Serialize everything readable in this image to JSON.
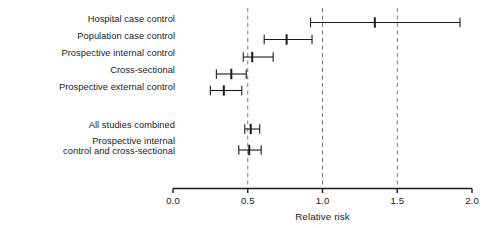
{
  "chart_data": {
    "type": "forest",
    "title": "",
    "xlabel": "Relative risk",
    "ylabel": "",
    "xlim": [
      0.0,
      2.0
    ],
    "grid": true,
    "gridlines": [
      0.5,
      1.0,
      1.5
    ],
    "gridline_style": "dashed",
    "legend": "none",
    "tick_labels": [
      "0.0",
      "0.5",
      "1.0",
      "1.5",
      "2.0"
    ],
    "tick_values": [
      0.0,
      0.5,
      1.0,
      1.5,
      2.0
    ],
    "categories": [
      "Hospital case control",
      "Population case control",
      "Prospective internal control",
      "Cross-sectional",
      "Prospective external control",
      "All studies combined",
      "Prospective internal\ncontrol and cross-sectional"
    ],
    "rows": [
      {
        "label": "Hospital case control",
        "label_lines": [
          "Hospital case control"
        ],
        "estimate": 1.35,
        "ci_low": 0.92,
        "ci_high": 1.92,
        "group": "individual"
      },
      {
        "label": "Population case control",
        "label_lines": [
          "Population case control"
        ],
        "estimate": 0.76,
        "ci_low": 0.61,
        "ci_high": 0.93,
        "group": "individual"
      },
      {
        "label": "Prospective internal control",
        "label_lines": [
          "Prospective internal control"
        ],
        "estimate": 0.53,
        "ci_low": 0.47,
        "ci_high": 0.67,
        "group": "individual"
      },
      {
        "label": "Cross-sectional",
        "label_lines": [
          "Cross-sectional"
        ],
        "estimate": 0.39,
        "ci_low": 0.29,
        "ci_high": 0.49,
        "group": "individual"
      },
      {
        "label": "Prospective external control",
        "label_lines": [
          "Prospective external control"
        ],
        "estimate": 0.34,
        "ci_low": 0.25,
        "ci_high": 0.46,
        "group": "individual"
      },
      {
        "label": "All studies combined",
        "label_lines": [
          "All studies combined"
        ],
        "estimate": 0.52,
        "ci_low": 0.48,
        "ci_high": 0.58,
        "group": "summary"
      },
      {
        "label": "Prospective internal control and cross-sectional",
        "label_lines": [
          "Prospective internal",
          "control and cross-sectional"
        ],
        "estimate": 0.51,
        "ci_low": 0.44,
        "ci_high": 0.59,
        "group": "summary"
      }
    ],
    "colors": {
      "line": "#1a1a1a",
      "marker": "#1a1a1a",
      "gridline": "#777777",
      "axis": "#1a1a1a",
      "background": "#ffffff"
    }
  }
}
